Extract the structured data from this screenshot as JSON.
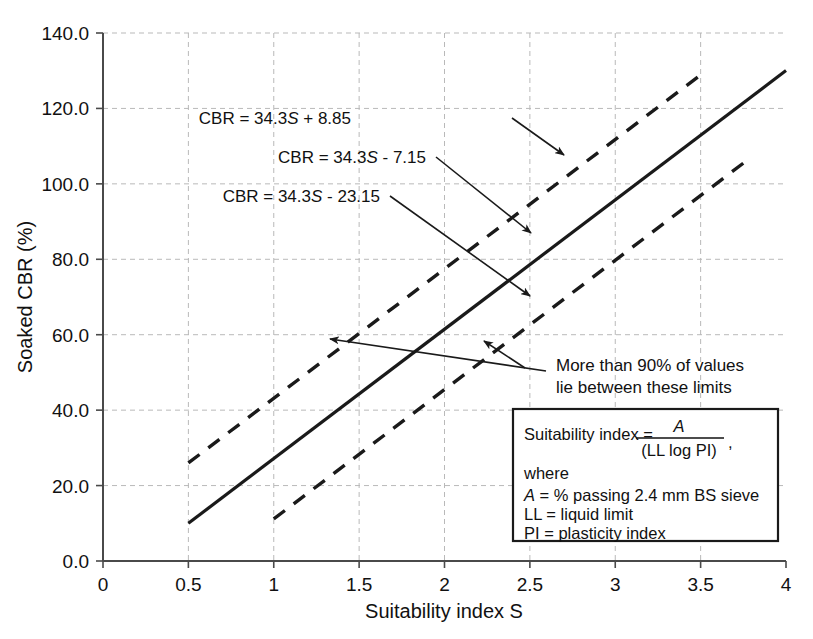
{
  "chart_data": {
    "type": "line",
    "title": "",
    "xlabel": "Suitability index S",
    "ylabel": "Soaked CBR (%)",
    "xlim": [
      0,
      4
    ],
    "ylim": [
      0,
      140
    ],
    "grid": true,
    "legend_position": "none",
    "x_ticks": [
      "0",
      "0.5",
      "1",
      "1.5",
      "2",
      "2.5",
      "3",
      "3.5",
      "4"
    ],
    "x_tick_values": [
      0,
      0.5,
      1,
      1.5,
      2,
      2.5,
      3,
      3.5,
      4
    ],
    "y_ticks": [
      "0.0",
      "20.0",
      "40.0",
      "60.0",
      "80.0",
      "100.0",
      "120.0",
      "140.0"
    ],
    "y_tick_values": [
      0,
      20,
      40,
      60,
      80,
      100,
      120,
      140
    ],
    "series": [
      {
        "name": "CBR = 34.3S + 8.85",
        "style": "dashed",
        "slope": 34.3,
        "intercept": 8.85,
        "x": [
          0.5,
          3.5
        ],
        "values": [
          26.0,
          128.9
        ]
      },
      {
        "name": "CBR = 34.3S - 7.15",
        "style": "solid",
        "slope": 34.3,
        "intercept": -7.15,
        "x": [
          0.5,
          4.0
        ],
        "values": [
          10.0,
          130.05
        ]
      },
      {
        "name": "CBR = 34.3S - 23.15",
        "style": "dashed",
        "slope": 34.3,
        "intercept": -23.15,
        "x": [
          1.0,
          3.8
        ],
        "values": [
          11.15,
          107.19
        ]
      }
    ],
    "annotations": [
      {
        "id": "eq-upper",
        "text_prefix": "CBR = 34.3",
        "text_var": "S",
        "text_suffix": " + 8.85",
        "target_x": 2.62,
        "target_y": 98.7
      },
      {
        "id": "eq-mid",
        "text_prefix": "CBR = 34.3",
        "text_var": "S",
        "text_suffix": " - 7.15",
        "target_x": 2.47,
        "target_y": 77.6
      },
      {
        "id": "eq-lower",
        "text_prefix": "CBR = 34.3",
        "text_var": "S",
        "text_suffix": " - 23.15",
        "target_x": 2.46,
        "target_y": 61.2
      },
      {
        "id": "limits-note",
        "line1": "More than 90% of values",
        "line2": "lie between these limits",
        "target_a_x": 1.45,
        "target_a_y": 60.0,
        "target_b_x": 2.33,
        "target_b_y": 57.8
      }
    ]
  },
  "legend_box": {
    "formula_label": "Suitability index  =",
    "numerator": "A",
    "denominator": "(LL log PI)",
    "comma": ",",
    "where_label": "where",
    "lines": [
      {
        "symbol": "A",
        "rest": " = % passing 2.4 mm BS sieve"
      },
      {
        "symbol": "LL",
        "rest": " = liquid limit"
      },
      {
        "symbol": "PI",
        "rest": " = plasticity index"
      }
    ]
  },
  "colors": {
    "line": "#1a1a1a",
    "grid": "#b9b9b9",
    "axis": "#4a4a4a",
    "background": "#ffffff"
  }
}
